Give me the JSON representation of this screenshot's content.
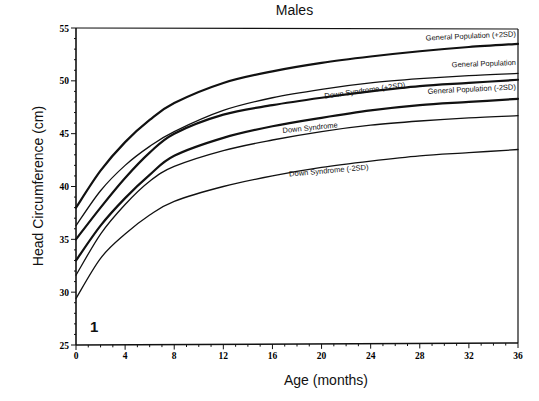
{
  "chart_data": {
    "type": "line",
    "title": "Males",
    "xlabel": "Age (months)",
    "ylabel": "Head Circumference (cm)",
    "panel_label": "1",
    "xlim": [
      0,
      36
    ],
    "ylim": [
      25,
      55
    ],
    "x_ticks": [
      0,
      4,
      8,
      12,
      16,
      20,
      24,
      28,
      32,
      36
    ],
    "y_ticks": [
      25,
      30,
      35,
      40,
      45,
      50,
      55
    ],
    "grid": false,
    "legend": "inline labels at right end of curves",
    "x": [
      0,
      2,
      4,
      6,
      8,
      12,
      16,
      20,
      24,
      28,
      32,
      36
    ],
    "series": [
      {
        "name": "General Population (+2SD)",
        "weight": "bold",
        "values": [
          38.0,
          41.5,
          44.2,
          46.3,
          47.9,
          49.8,
          50.9,
          51.7,
          52.3,
          52.8,
          53.2,
          53.5
        ]
      },
      {
        "name": "General Population",
        "weight": "normal",
        "values": [
          36.3,
          39.6,
          42.0,
          43.8,
          45.2,
          47.2,
          48.4,
          49.2,
          49.8,
          50.2,
          50.5,
          50.7
        ]
      },
      {
        "name": "Down Syndrome (+2SD)",
        "weight": "bold",
        "values": [
          35.0,
          38.0,
          40.8,
          43.2,
          45.0,
          46.8,
          47.7,
          48.4,
          49.0,
          49.5,
          49.8,
          50.1
        ]
      },
      {
        "name": "General Population (-2SD)",
        "weight": "bold",
        "values": [
          33.0,
          36.3,
          38.9,
          41.1,
          42.9,
          44.6,
          45.7,
          46.5,
          47.2,
          47.7,
          48.0,
          48.3
        ]
      },
      {
        "name": "Down Syndrome",
        "weight": "normal",
        "values": [
          31.6,
          35.5,
          38.3,
          40.5,
          41.9,
          43.4,
          44.4,
          45.2,
          45.8,
          46.2,
          46.5,
          46.7
        ]
      },
      {
        "name": "Down Syndrome (-2SD)",
        "weight": "normal",
        "values": [
          29.4,
          33.2,
          35.5,
          37.3,
          38.6,
          40.0,
          41.0,
          41.8,
          42.4,
          42.9,
          43.2,
          43.5
        ]
      }
    ],
    "label_positions": [
      {
        "text": "General Population (+2SD)",
        "x": 36,
        "y": 54.2,
        "anchor": "end",
        "rotate": -2.5
      },
      {
        "text": "General Population",
        "x": 36,
        "y": 51.5,
        "anchor": "end",
        "rotate": -2
      },
      {
        "text": "Down Syndrome (+2SD)",
        "x": 27,
        "y": 49.4,
        "anchor": "end",
        "rotate": -8
      },
      {
        "text": "General Population (-2SD)",
        "x": 36,
        "y": 49.2,
        "anchor": "end",
        "rotate": -3
      },
      {
        "text": "Down Syndrome",
        "x": 21.5,
        "y": 45.6,
        "anchor": "end",
        "rotate": -6
      },
      {
        "text": "Down Syndrome (-2SD)",
        "x": 24,
        "y": 41.6,
        "anchor": "end",
        "rotate": -5
      }
    ]
  }
}
